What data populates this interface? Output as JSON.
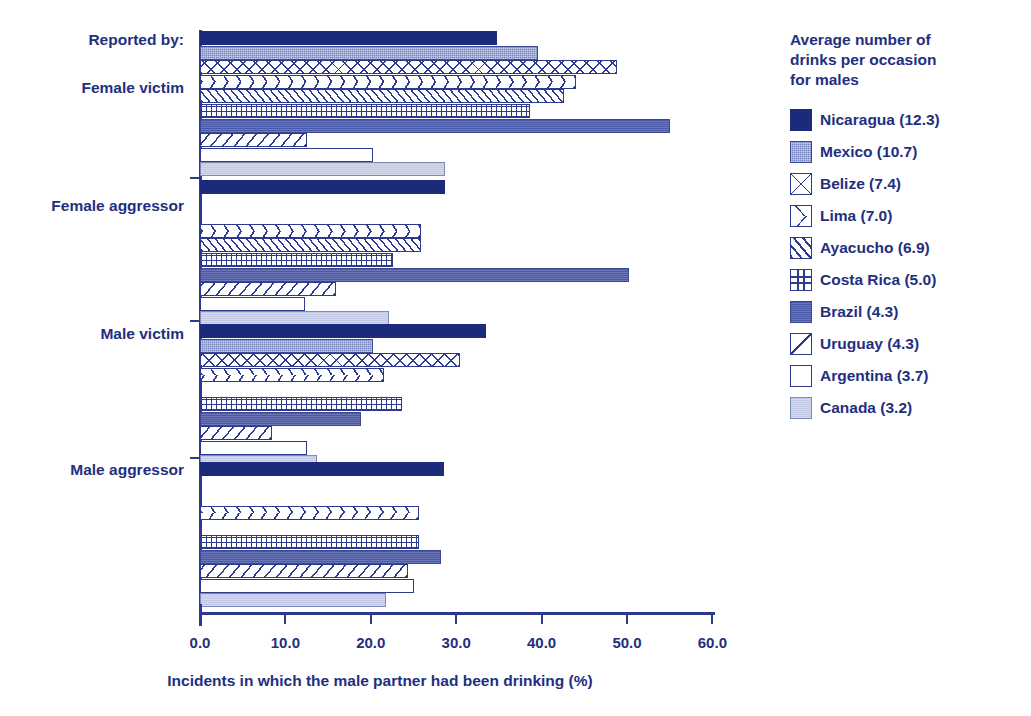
{
  "chart_data": {
    "type": "bar",
    "orientation": "horizontal",
    "title": "",
    "xlabel": "Incidents in which the male partner had been drinking (%)",
    "ylabel": "Reported by:",
    "xlim": [
      0.0,
      60.0
    ],
    "xticks": [
      "0.0",
      "10.0",
      "20.0",
      "30.0",
      "40.0",
      "50.0",
      "60.0"
    ],
    "grid": false,
    "legend_position": "right",
    "categories": [
      "Female victim",
      "Female aggressor",
      "Male victim",
      "Male aggressor"
    ],
    "series": [
      {
        "name": "Nicaragua (12.3)",
        "pattern": "solid-dark",
        "values": [
          34.8,
          28.7,
          33.5,
          28.6
        ]
      },
      {
        "name": "Mexico (10.7)",
        "pattern": "dots-mid",
        "values": [
          39.6,
          null,
          20.2,
          null
        ]
      },
      {
        "name": "Belize (7.4)",
        "pattern": "diamond",
        "values": [
          48.8,
          null,
          30.5,
          null
        ]
      },
      {
        "name": "Lima (7.0)",
        "pattern": "chevron",
        "values": [
          44.0,
          25.9,
          21.5,
          25.6
        ]
      },
      {
        "name": "Ayacucho (6.9)",
        "pattern": "diag-left",
        "values": [
          42.6,
          25.9,
          null,
          null
        ]
      },
      {
        "name": "Costa Rica (5.0)",
        "pattern": "grid",
        "values": [
          38.7,
          22.6,
          23.6,
          25.6
        ]
      },
      {
        "name": "Brazil (4.3)",
        "pattern": "solid-mid",
        "values": [
          55.0,
          50.2,
          18.8,
          28.2
        ]
      },
      {
        "name": "Uruguay (4.3)",
        "pattern": "diag-right",
        "values": [
          12.5,
          15.9,
          8.4,
          24.4
        ]
      },
      {
        "name": "Argentina (3.7)",
        "pattern": "empty",
        "values": [
          20.2,
          12.3,
          12.5,
          25.1
        ]
      },
      {
        "name": "Canada (3.2)",
        "pattern": "light",
        "values": [
          28.7,
          22.1,
          13.7,
          21.8
        ]
      }
    ]
  },
  "legend": {
    "title": "Average number of\ndrinks per occasion\nfor males"
  },
  "axis": {
    "reported_by_label": "Reported by:"
  }
}
